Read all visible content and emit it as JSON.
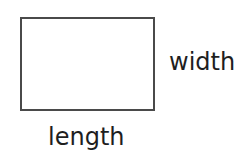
{
  "diagram": {
    "type": "labeled-rectangle",
    "shape": {
      "kind": "rectangle",
      "stroke_color": "#4a4a4a",
      "fill_color": "#ffffff"
    },
    "labels": {
      "width": "width",
      "length": "length"
    }
  }
}
